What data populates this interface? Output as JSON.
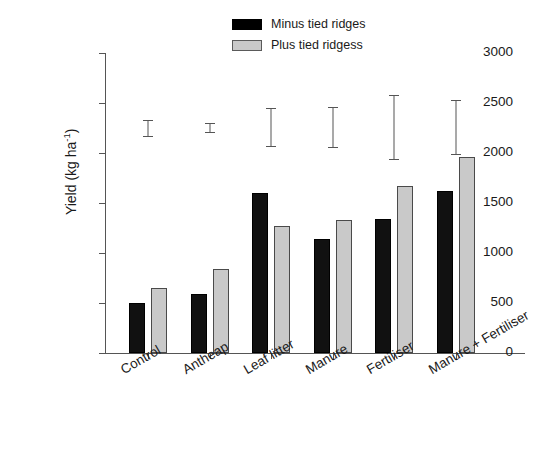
{
  "chart_data": {
    "type": "bar",
    "title": "",
    "xlabel": "",
    "ylabel": "Yield (kg ha-1)",
    "ylabel_base": "Yield (kg ha",
    "ylabel_sup": "-1",
    "ylabel_close": ")",
    "categories": [
      "Control",
      "Antheap",
      "Leaf litter",
      "Manure",
      "Fertiliser",
      "Manure + Fertiliser"
    ],
    "series": [
      {
        "name": "Minus tied ridges",
        "color": "#111111",
        "values": [
          500,
          590,
          1600,
          1140,
          1340,
          1620
        ]
      },
      {
        "name": "Plus tied ridgess",
        "color": "#c9c9c9",
        "values": [
          650,
          840,
          1270,
          1330,
          1670,
          1960
        ]
      }
    ],
    "error_bars": {
      "description": "LSD interval bars plotted above groups",
      "values": [
        {
          "category": "Control",
          "low": 2160,
          "high": 2330
        },
        {
          "category": "Antheap",
          "low": 2200,
          "high": 2300
        },
        {
          "category": "Leaf litter",
          "low": 2060,
          "high": 2450
        },
        {
          "category": "Manure",
          "low": 2055,
          "high": 2460
        },
        {
          "category": "Fertiliser",
          "low": 1935,
          "high": 2580
        },
        {
          "category": "Manure + Fertiliser",
          "low": 1985,
          "high": 2530
        }
      ]
    },
    "ylim": [
      0,
      3000
    ],
    "ytick_values": [
      0,
      500,
      1000,
      1500,
      2000,
      2500,
      3000
    ],
    "ytick_labels": [
      "0",
      "500",
      "1000",
      "1500",
      "2000",
      "2500",
      "3000"
    ],
    "grid": false,
    "legend_position": "top-center"
  },
  "legend": {
    "entries": [
      {
        "label": "Minus tied ridges",
        "swatch": "black"
      },
      {
        "label": "Plus tied ridgess",
        "swatch": "gray"
      }
    ]
  }
}
